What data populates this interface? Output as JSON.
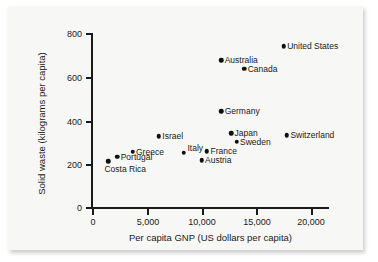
{
  "figure": {
    "background_color": "#f7f7f5",
    "axis_color": "#1a1a1a",
    "marker_color": "#111111"
  },
  "chart_data": {
    "type": "scatter",
    "title": "",
    "xlabel": "Per capita GNP (US dollars per capita)",
    "ylabel": "Solid waste (kilograms per capita)",
    "xlim": [
      0,
      21500
    ],
    "ylim": [
      0,
      800
    ],
    "xticks": [
      0,
      5000,
      10000,
      15000,
      20000
    ],
    "xtick_labels": [
      "0",
      "5,000",
      "10,000",
      "15,000",
      "20,000"
    ],
    "yticks": [
      0,
      200,
      400,
      600,
      800
    ],
    "ytick_labels": [
      "0",
      "200",
      "400",
      "600",
      "800"
    ],
    "grid": false,
    "legend": "none",
    "points": [
      {
        "label": "Costa Rica",
        "x": 1500,
        "y": 210,
        "label_pos": "below"
      },
      {
        "label": "Portugal",
        "x": 2300,
        "y": 230,
        "label_pos": "right"
      },
      {
        "label": "Greece",
        "x": 3700,
        "y": 255,
        "label_pos": "right"
      },
      {
        "label": "Israel",
        "x": 6100,
        "y": 325,
        "label_pos": "right"
      },
      {
        "label": "Italy",
        "x": 8400,
        "y": 250,
        "label_pos": "above-right"
      },
      {
        "label": "France",
        "x": 10500,
        "y": 257,
        "label_pos": "right"
      },
      {
        "label": "Austria",
        "x": 10000,
        "y": 215,
        "label_pos": "right"
      },
      {
        "label": "Germany",
        "x": 11800,
        "y": 440,
        "label_pos": "right"
      },
      {
        "label": "Australia",
        "x": 11800,
        "y": 675,
        "label_pos": "right"
      },
      {
        "label": "Japan",
        "x": 12700,
        "y": 340,
        "label_pos": "right"
      },
      {
        "label": "Sweden",
        "x": 13200,
        "y": 300,
        "label_pos": "right"
      },
      {
        "label": "Canada",
        "x": 13900,
        "y": 635,
        "label_pos": "right"
      },
      {
        "label": "United States",
        "x": 17500,
        "y": 740,
        "label_pos": "right"
      },
      {
        "label": "Switzerland",
        "x": 17800,
        "y": 330,
        "label_pos": "right"
      }
    ]
  }
}
